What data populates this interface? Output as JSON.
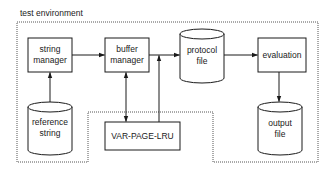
{
  "diagram": {
    "title": "test environment",
    "nodes": [
      {
        "id": "string-manager",
        "shape": "box",
        "lines": [
          "string",
          "manager"
        ]
      },
      {
        "id": "buffer-manager",
        "shape": "box",
        "lines": [
          "buffer",
          "manager"
        ]
      },
      {
        "id": "protocol-file",
        "shape": "cylinder",
        "lines": [
          "protocol",
          "file"
        ]
      },
      {
        "id": "evaluation",
        "shape": "box",
        "lines": [
          "evaluation"
        ]
      },
      {
        "id": "reference-string",
        "shape": "cylinder",
        "lines": [
          "reference",
          "string"
        ]
      },
      {
        "id": "var-page-lru",
        "shape": "box",
        "lines": [
          "VAR-PAGE-LRU"
        ]
      },
      {
        "id": "output-file",
        "shape": "cylinder",
        "lines": [
          "output",
          "file"
        ]
      }
    ],
    "edges": [
      {
        "from": "reference-string",
        "to": "string-manager"
      },
      {
        "from": "string-manager",
        "to": "buffer-manager"
      },
      {
        "from": "buffer-manager",
        "to": "protocol-file"
      },
      {
        "from": "buffer-manager",
        "to": "var-page-lru",
        "bidirectional": true
      },
      {
        "from": "var-page-lru",
        "to": "buffer-manager-output-line"
      },
      {
        "from": "protocol-file",
        "to": "evaluation"
      },
      {
        "from": "evaluation",
        "to": "output-file"
      }
    ],
    "colors": {
      "stroke": "#1a1a1a",
      "boundary": "#555555",
      "background": "#ffffff"
    }
  }
}
